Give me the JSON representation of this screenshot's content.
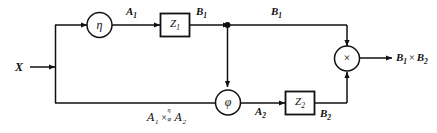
{
  "diagram": {
    "type": "block-flow-diagram",
    "title_annotation": {
      "left_operand": "A",
      "left_sub": "1",
      "operator": "×",
      "operator_superscript": "η",
      "operator_subscript": "φ",
      "right_operand": "A",
      "right_sub": "2"
    },
    "input": {
      "label": "X"
    },
    "output": {
      "label_main": "B",
      "label_main_sub": "1",
      "label_op": "×",
      "label_second": "B",
      "label_second_sub": "2"
    },
    "nodes": [
      {
        "id": "eta",
        "kind": "circle",
        "glyph": "η",
        "name": "eta-node"
      },
      {
        "id": "z1",
        "kind": "box",
        "glyph": "Z",
        "sub": "1",
        "name": "z1-block"
      },
      {
        "id": "phi",
        "kind": "circle",
        "glyph": "φ",
        "name": "phi-node"
      },
      {
        "id": "z2",
        "kind": "box",
        "glyph": "Z",
        "sub": "2",
        "name": "z2-block"
      },
      {
        "id": "mult",
        "kind": "circle",
        "glyph": "×",
        "name": "multiplier-node"
      }
    ],
    "edge_labels": [
      {
        "id": "a1",
        "text": "A",
        "sub": "1"
      },
      {
        "id": "b1_left",
        "text": "B",
        "sub": "1"
      },
      {
        "id": "b1_right",
        "text": "B",
        "sub": "1"
      },
      {
        "id": "a2",
        "text": "A",
        "sub": "2"
      },
      {
        "id": "b2",
        "text": "B",
        "sub": "2"
      }
    ],
    "colors": {
      "stroke": "#111111",
      "background": "#ffffff",
      "text": "#111111"
    }
  }
}
